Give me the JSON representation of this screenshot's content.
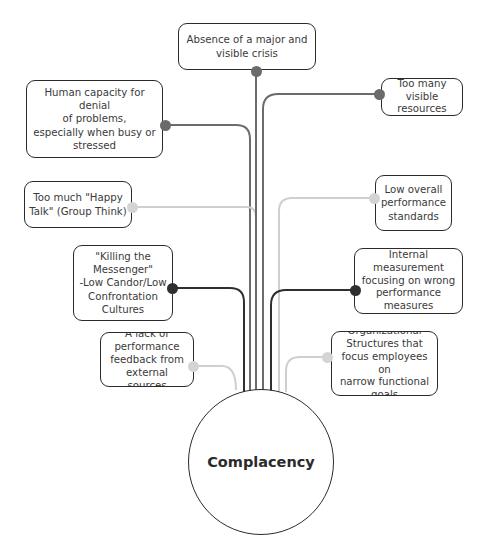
{
  "diagram": {
    "type": "mind-map",
    "center": {
      "label": "Complacency",
      "cx": 261,
      "cy": 462,
      "r": 73
    },
    "colors": {
      "dark": "#2f2f2f",
      "medium": "#6b6b6b",
      "light": "#cfcfcf",
      "border": "#2b2b2b"
    },
    "nodes": [
      {
        "id": "absence-of-crisis",
        "label": "Absence of a major and\nvisible crisis",
        "x": 178,
        "y": 23,
        "w": 138,
        "h": 47,
        "dot": [
          256,
          71
        ],
        "tone": "medium"
      },
      {
        "id": "denial-of-problems",
        "label": "Human capacity for denial\nof problems,\nespecially when busy or\nstressed",
        "x": 26,
        "y": 80,
        "w": 137,
        "h": 78,
        "dot": [
          165,
          125
        ],
        "tone": "medium"
      },
      {
        "id": "too-many-resources",
        "label": "Too many\nvisible\nresources",
        "x": 381,
        "y": 78,
        "w": 82,
        "h": 38,
        "dot": [
          379,
          94
        ],
        "tone": "medium"
      },
      {
        "id": "happy-talk",
        "label": "Too much \"Happy\nTalk\" (Group Think)",
        "x": 24,
        "y": 181,
        "w": 108,
        "h": 47,
        "dot": [
          132,
          207
        ],
        "tone": "light"
      },
      {
        "id": "low-standards",
        "label": "Low overall\nperformance\nstandards",
        "x": 375,
        "y": 175,
        "w": 77,
        "h": 56,
        "dot": [
          374,
          198
        ],
        "tone": "light"
      },
      {
        "id": "killing-messenger",
        "label": "\"Killing the\nMessenger\"\n-Low Candor/Low\nConfrontation\nCultures",
        "x": 73,
        "y": 245,
        "w": 100,
        "h": 76,
        "dot": [
          172,
          288
        ],
        "tone": "dark"
      },
      {
        "id": "internal-measurement",
        "label": "Internal\nmeasurement\nfocusing on wrong\nperformance\nmeasures",
        "x": 354,
        "y": 248,
        "w": 109,
        "h": 66,
        "dot": [
          355,
          290
        ],
        "tone": "dark"
      },
      {
        "id": "lack-of-feedback",
        "label": "A lack of\nperformance\nfeedback from\nexternal sources",
        "x": 100,
        "y": 332,
        "w": 94,
        "h": 55,
        "dot": [
          193,
          366
        ],
        "tone": "light"
      },
      {
        "id": "org-structures",
        "label": "Organizational\nStructures that\nfocus employees on\nnarrow functional\ngoals",
        "x": 331,
        "y": 331,
        "w": 107,
        "h": 65,
        "dot": [
          327,
          357
        ],
        "tone": "light"
      }
    ]
  }
}
